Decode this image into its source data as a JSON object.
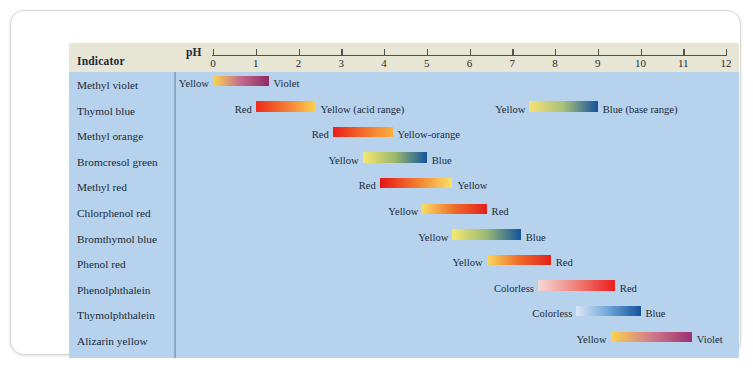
{
  "figure": {
    "title_column_header": "Indicator",
    "ph_axis_label": "pH",
    "axis": {
      "min": 0,
      "max": 12,
      "ticks": [
        0,
        1,
        2,
        3,
        4,
        5,
        6,
        7,
        8,
        9,
        10,
        11,
        12
      ],
      "tick_labels": [
        "0",
        "1",
        "2",
        "3",
        "4",
        "5",
        "6",
        "7",
        "8",
        "9",
        "10",
        "11",
        "12"
      ]
    },
    "panel_color": "#b6d2ec",
    "header_color": "#e7e5d4"
  },
  "chart_data": {
    "type": "bar",
    "xlabel": "pH",
    "ylabel": "Indicator",
    "xlim": [
      0,
      12
    ],
    "grid": false,
    "legend": "none",
    "categories": [
      "Methyl violet",
      "Thymol blue",
      "Methyl orange",
      "Bromcresol green",
      "Methyl red",
      "Chlorphenol red",
      "Bromthymol blue",
      "Phenol red",
      "Phenolphthalein",
      "Thymolphthalein",
      "Alizarin yellow"
    ],
    "rows": [
      {
        "indicator": "Methyl violet",
        "bands": [
          {
            "ph_start": 0.0,
            "ph_end": 1.3,
            "left_label": "Yellow",
            "right_label": "Violet",
            "color_start": "#fbd34d",
            "color_mid": "#c4698f",
            "color_end": "#8e2b62"
          }
        ]
      },
      {
        "indicator": "Thymol blue",
        "bands": [
          {
            "ph_start": 1.0,
            "ph_end": 2.4,
            "left_label": "Red",
            "right_label": "Yellow (acid range)",
            "color_start": "#ee2b1c",
            "color_mid": "#f47a35",
            "color_end": "#fbd34d"
          },
          {
            "ph_start": 7.4,
            "ph_end": 9.0,
            "left_label": "Yellow",
            "right_label": "Blue (base range)",
            "color_start": "#f7e271",
            "color_mid": "#a8c07a",
            "color_end": "#13539b"
          }
        ]
      },
      {
        "indicator": "Methyl orange",
        "bands": [
          {
            "ph_start": 2.8,
            "ph_end": 4.2,
            "left_label": "Red",
            "right_label": "Yellow-orange",
            "color_start": "#ec1d19",
            "color_mid": "#f26c2c",
            "color_end": "#fbb040"
          }
        ]
      },
      {
        "indicator": "Bromcresol green",
        "bands": [
          {
            "ph_start": 3.5,
            "ph_end": 5.0,
            "left_label": "Yellow",
            "right_label": "Blue",
            "color_start": "#f7e870",
            "color_mid": "#9ab86b",
            "color_end": "#14559c"
          }
        ]
      },
      {
        "indicator": "Methyl red",
        "bands": [
          {
            "ph_start": 3.9,
            "ph_end": 5.6,
            "left_label": "Red",
            "right_label": "Yellow",
            "color_start": "#e5151a",
            "color_mid": "#f47a2c",
            "color_end": "#f9e265"
          }
        ]
      },
      {
        "indicator": "Chlorphenol red",
        "bands": [
          {
            "ph_start": 4.9,
            "ph_end": 6.4,
            "left_label": "Yellow",
            "right_label": "Red",
            "color_start": "#f9dc62",
            "color_mid": "#ef6b2a",
            "color_end": "#e2201b"
          }
        ]
      },
      {
        "indicator": "Bromthymol blue",
        "bands": [
          {
            "ph_start": 5.6,
            "ph_end": 7.2,
            "left_label": "Yellow",
            "right_label": "Blue",
            "color_start": "#f7e870",
            "color_mid": "#98ba73",
            "color_end": "#13539b"
          }
        ]
      },
      {
        "indicator": "Phenol red",
        "bands": [
          {
            "ph_start": 6.4,
            "ph_end": 7.9,
            "left_label": "Yellow",
            "right_label": "Red",
            "color_start": "#f9d85c",
            "color_mid": "#ee6c2b",
            "color_end": "#e2201b"
          }
        ]
      },
      {
        "indicator": "Phenolphthalein",
        "bands": [
          {
            "ph_start": 7.6,
            "ph_end": 9.4,
            "left_label": "Colorless",
            "right_label": "Red",
            "color_start": "#f2d9d6",
            "color_mid": "#f08179",
            "color_end": "#ec1c1c"
          }
        ]
      },
      {
        "indicator": "Thymolphthalein",
        "bands": [
          {
            "ph_start": 8.5,
            "ph_end": 10.0,
            "left_label": "Colorless",
            "right_label": "Blue",
            "color_start": "#dbe8f6",
            "color_mid": "#6ea5d8",
            "color_end": "#14549d"
          }
        ]
      },
      {
        "indicator": "Alizarin yellow",
        "bands": [
          {
            "ph_start": 9.3,
            "ph_end": 11.2,
            "left_label": "Yellow",
            "right_label": "Violet",
            "color_start": "#fbd34d",
            "color_mid": "#d07a8c",
            "color_end": "#9c3070"
          }
        ]
      }
    ]
  }
}
